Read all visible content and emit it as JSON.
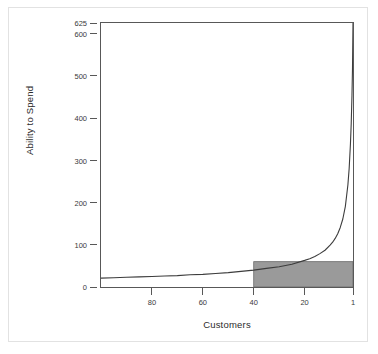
{
  "chart_data": {
    "type": "line",
    "title": "",
    "xlabel": "Customers",
    "ylabel": "Ability to Spend",
    "grid": false,
    "legend": false,
    "x_axis_reversed": true,
    "xlim": [
      100,
      1
    ],
    "ylim": [
      0,
      625
    ],
    "xticks": [
      80,
      60,
      40,
      20,
      1
    ],
    "xtick_labels": [
      "80",
      "60",
      "40",
      "20",
      "1"
    ],
    "yticks": [
      0,
      100,
      200,
      300,
      400,
      500,
      600,
      625
    ],
    "ytick_labels": [
      "0",
      "100",
      "200",
      "300",
      "400",
      "500",
      "600",
      "625"
    ],
    "series": [
      {
        "name": "Ability to Spend",
        "description": "Pareto power-law curve rising steeply toward customer rank 1",
        "x": [
          100,
          95,
          90,
          85,
          80,
          75,
          70,
          65,
          60,
          55,
          50,
          45,
          40,
          35,
          30,
          25,
          20,
          18,
          16,
          14,
          12,
          10,
          9,
          8,
          7,
          6,
          5,
          4,
          3,
          2.5,
          2,
          1.7,
          1.4,
          1.2,
          1.0
        ],
        "y": [
          21,
          22,
          23,
          24,
          25,
          26,
          27,
          29,
          30,
          32,
          34,
          37,
          40,
          44,
          48,
          54,
          63,
          67,
          72,
          79,
          87,
          99,
          106,
          115,
          126,
          141,
          161,
          191,
          242,
          281,
          339,
          387,
          454,
          516,
          625
        ]
      }
    ],
    "annotations": [
      {
        "type": "rectangle",
        "name": "shaded-revenue-block",
        "x_from": 40,
        "x_to": 1,
        "y_from": 0,
        "y_to": 60,
        "fill": "#9a9a9a",
        "stroke": "#6a6a6a"
      }
    ],
    "colors": {
      "curve": "#3c3c3c",
      "axis": "#585858",
      "shade_fill": "#9a9a9a",
      "shade_stroke": "#6f6f6f",
      "background": "#ffffff",
      "outer_frame": "#e2e2e2",
      "text": "#3a3a3a"
    }
  }
}
